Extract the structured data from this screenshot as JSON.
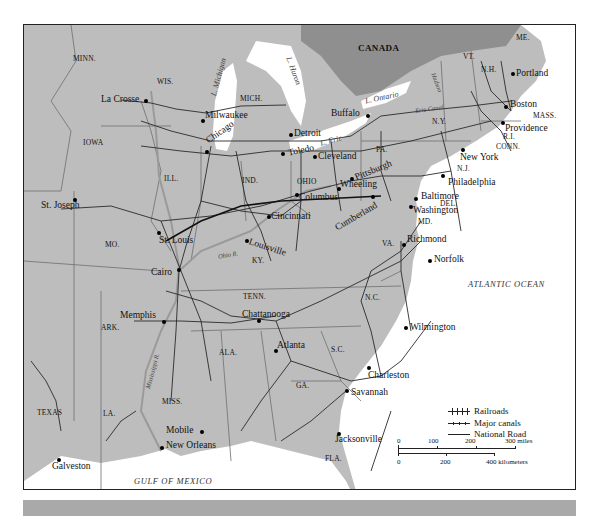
{
  "map": {
    "title_visible": false,
    "colors": {
      "land": "#bdbdbd",
      "canada": "#8f8f8f",
      "water": "#ffffff",
      "rail": "#2a2a2a",
      "border": "#6e6e6e",
      "frame": "#222222",
      "bottom_bar": "#a9a9a9"
    },
    "country_labels": [
      "CANADA"
    ],
    "state_labels": [
      "MINN.",
      "WIS.",
      "MICH.",
      "IOWA",
      "ILL.",
      "IND.",
      "OHIO",
      "PA.",
      "N.Y.",
      "VT.",
      "N.H.",
      "ME.",
      "MASS.",
      "R.I.",
      "CONN.",
      "N.J.",
      "DEL.",
      "MD.",
      "VA.",
      "MO.",
      "KY.",
      "TENN.",
      "N.C.",
      "S.C.",
      "GA.",
      "ALA.",
      "MISS.",
      "ARK.",
      "LA.",
      "TEXAS",
      "FLA."
    ],
    "cities": [
      "La Crosse",
      "Milwaukee",
      "Chicago",
      "Detroit",
      "Toledo",
      "Buffalo",
      "Cleveland",
      "Pittsburgh",
      "Wheeling",
      "Columbus",
      "Cincinnati",
      "Cumberland",
      "Baltimore",
      "Washington",
      "Philadelphia",
      "New York",
      "Providence",
      "Boston",
      "Portland",
      "Richmond",
      "Norfolk",
      "St. Joseph",
      "St. Louis",
      "Louisville",
      "Cairo",
      "Memphis",
      "Chattanooga",
      "Atlanta",
      "Wilmington",
      "Charleston",
      "Savannah",
      "Jacksonville",
      "Mobile",
      "New Orleans",
      "Galveston"
    ],
    "water_labels": {
      "lake_michigan": "L. Michigan",
      "lake_huron": "L. Huron",
      "lake_erie": "L. Erie",
      "lake_ontario": "L. Ontario",
      "erie_canal": "Erie Canal",
      "hudson": "Hudson",
      "ohio_river": "Ohio R.",
      "mississippi_river": "Mississippi R.",
      "atlantic": "ATLANTIC OCEAN",
      "gulf": "GULF OF MEXICO"
    },
    "legend": {
      "railroads": "Railroads",
      "canals": "Major canals",
      "national_road": "National Road"
    },
    "scale": {
      "miles_ticks": [
        "0",
        "100",
        "200",
        "300 miles"
      ],
      "km_ticks": [
        "0",
        "200",
        "400 kilometers"
      ]
    }
  },
  "labels": {
    "CANADA": "CANADA",
    "MINN": "MINN.",
    "WIS": "WIS.",
    "MICH": "MICH.",
    "IOWA": "IOWA",
    "ILL": "ILL.",
    "IND": "IND.",
    "OHIO": "OHIO",
    "PA": "PA.",
    "NY": "N.Y.",
    "VT": "VT.",
    "NH": "N.H.",
    "ME": "ME.",
    "MASS": "MASS.",
    "RI": "R.I.",
    "CONN": "CONN.",
    "NJ": "N.J.",
    "DEL": "DEL.",
    "MD": "MD.",
    "VA": "VA.",
    "MO": "MO.",
    "KY": "KY.",
    "TENN": "TENN.",
    "NC": "N.C.",
    "SC": "S.C.",
    "GA": "GA.",
    "ALA": "ALA.",
    "MISS": "MISS.",
    "ARK": "ARK.",
    "LA": "LA.",
    "TEXAS": "TEXAS",
    "FLA": "FLA."
  }
}
